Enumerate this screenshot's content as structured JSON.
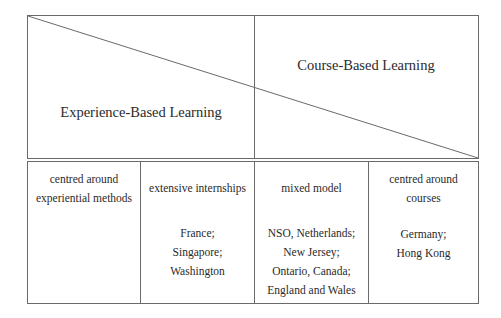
{
  "top": {
    "left_label": "Experience-Based Learning",
    "right_label": "Course-Based Learning"
  },
  "columns": [
    {
      "heading_lines": [
        "centred around",
        "experiential methods"
      ],
      "places": []
    },
    {
      "heading_lines": [
        "extensive internships"
      ],
      "places": [
        "France;",
        "Singapore;",
        "Washington"
      ]
    },
    {
      "heading_lines": [
        "mixed model"
      ],
      "places": [
        "NSO, Netherlands;",
        "New Jersey;",
        "Ontario, Canada;",
        "England and Wales"
      ]
    },
    {
      "heading_lines": [
        "centred around",
        "courses"
      ],
      "places": [
        "Germany;",
        "Hong Kong"
      ]
    }
  ],
  "colors": {
    "line": "#6a6a6a",
    "text": "#2a2a2a",
    "background": "#ffffff"
  }
}
